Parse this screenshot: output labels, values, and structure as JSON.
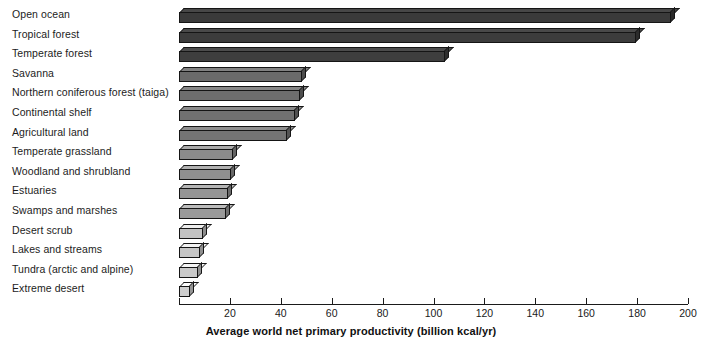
{
  "chart_data": {
    "type": "bar",
    "orientation": "horizontal",
    "title": "",
    "xlabel": "Average world net primary productivity (billion kcal/yr)",
    "ylabel": "",
    "xlim": [
      0,
      200
    ],
    "xticks": [
      0,
      20,
      40,
      60,
      80,
      100,
      120,
      140,
      160,
      180,
      200
    ],
    "xtick_labels": [
      "",
      "20",
      "40",
      "60",
      "80",
      "100",
      "120",
      "140",
      "160",
      "180",
      "200"
    ],
    "grid": false,
    "legend": null,
    "categories": [
      "Open ocean",
      "Tropical forest",
      "Temperate forest",
      "Savanna",
      "Northern coniferous forest (taiga)",
      "Continental shelf",
      "Agricultural land",
      "Temperate grassland",
      "Woodland and shrubland",
      "Estuaries",
      "Swamps and marshes",
      "Desert scrub",
      "Lakes and streams",
      "Tundra (arctic and alpine)",
      "Extreme desert"
    ],
    "values": [
      193,
      179,
      104,
      48,
      47,
      45,
      42,
      21,
      20,
      19,
      18,
      9,
      8,
      7,
      4
    ],
    "bar_colors": [
      "#3a3a3a",
      "#3c3c3c",
      "#3e3e3e",
      "#6a6a6a",
      "#6e6e6e",
      "#717171",
      "#747474",
      "#8b8b8b",
      "#909090",
      "#959595",
      "#9a9a9a",
      "#c2c2c2",
      "#c6c6c6",
      "#cacaca",
      "#cfcfcf"
    ]
  },
  "axis": {
    "title": "Average world net primary productivity (billion kcal/yr)"
  }
}
